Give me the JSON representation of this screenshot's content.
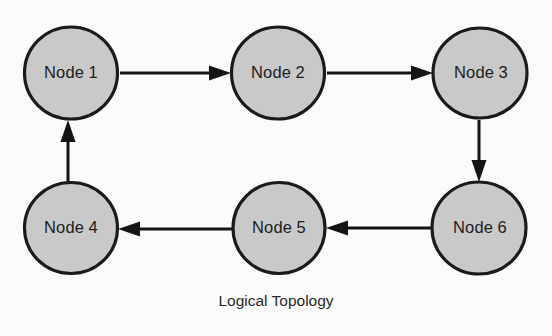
{
  "figure": {
    "caption": "Logical Topology",
    "background_color": "#fbfbfb",
    "node_fill_color": "#c9c9c9",
    "node_stroke_color": "#1a1a1a",
    "edge_color": "#141414",
    "text_color": "#1c1c1c"
  },
  "nodes": [
    {
      "id": "node-1",
      "label": "Node 1",
      "cx": 71,
      "cy": 73,
      "rx": 46.5,
      "ry": 46
    },
    {
      "id": "node-2",
      "label": "Node 2",
      "cx": 278,
      "cy": 73,
      "rx": 46.5,
      "ry": 46
    },
    {
      "id": "node-3",
      "label": "Node 3",
      "cx": 480,
      "cy": 73,
      "rx": 47,
      "ry": 45
    },
    {
      "id": "node-4",
      "label": "Node 4",
      "cx": 71,
      "cy": 228,
      "rx": 46.5,
      "ry": 45.5
    },
    {
      "id": "node-5",
      "label": "Node 5",
      "cx": 279,
      "cy": 228,
      "rx": 46,
      "ry": 45.5
    },
    {
      "id": "node-6",
      "label": "Node 6",
      "cx": 479,
      "cy": 228,
      "rx": 47,
      "ry": 46
    }
  ],
  "edges": [
    {
      "id": "edge-1-2",
      "from": "Node 1",
      "to": "Node 2",
      "direction": "right"
    },
    {
      "id": "edge-2-3",
      "from": "Node 2",
      "to": "Node 3",
      "direction": "right"
    },
    {
      "id": "edge-3-6",
      "from": "Node 3",
      "to": "Node 6",
      "direction": "down"
    },
    {
      "id": "edge-6-5",
      "from": "Node 6",
      "to": "Node 5",
      "direction": "left"
    },
    {
      "id": "edge-5-4",
      "from": "Node 5",
      "to": "Node 4",
      "direction": "left"
    },
    {
      "id": "edge-4-1",
      "from": "Node 4",
      "to": "Node 1",
      "direction": "up"
    }
  ]
}
